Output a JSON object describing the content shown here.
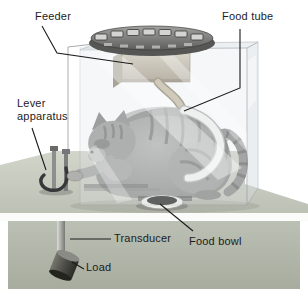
{
  "figure": {
    "type": "textbook-illustration",
    "labels": {
      "feeder": "Feeder",
      "food_tube": "Food tube",
      "lever_apparatus": "Lever apparatus",
      "transducer": "Transducer",
      "food_bowl": "Food bowl",
      "load": "Load"
    },
    "colors": {
      "background": "#ffffff",
      "table_top": "#c8ccc1",
      "table_front": "#b4b9ad",
      "chamber_glass_edge": "#9aa0a5",
      "feeder_disk": "#6a6a68",
      "feeder_box": "#c3bbaa",
      "food_tube": "#cbc0a8",
      "white_tube": "#f4f4f2",
      "cat_fur": "#9c9c9a",
      "load_metal": "#4a4a46",
      "label_text": "#1c1c1c"
    }
  }
}
